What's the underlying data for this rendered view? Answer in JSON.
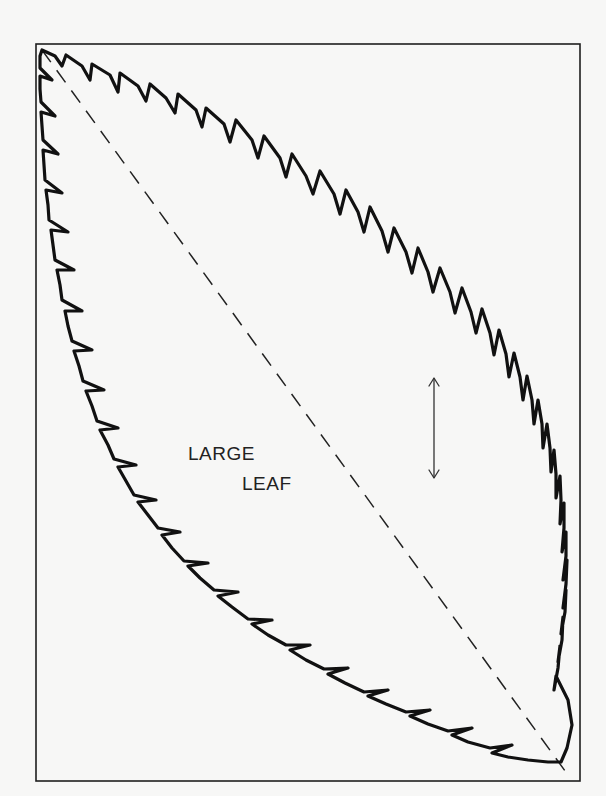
{
  "diagram": {
    "type": "pattern-template",
    "subject": "leaf",
    "label": {
      "line1": "LARGE",
      "line2": "LEAF"
    },
    "elements": {
      "frame": "rectangular border",
      "outline": "serrated leaf outline",
      "midrib": "dashed diagonal line",
      "indicator": "double-headed vertical arrow"
    },
    "colors": {
      "background": "#f7f7f6",
      "ink": "#111111"
    }
  }
}
